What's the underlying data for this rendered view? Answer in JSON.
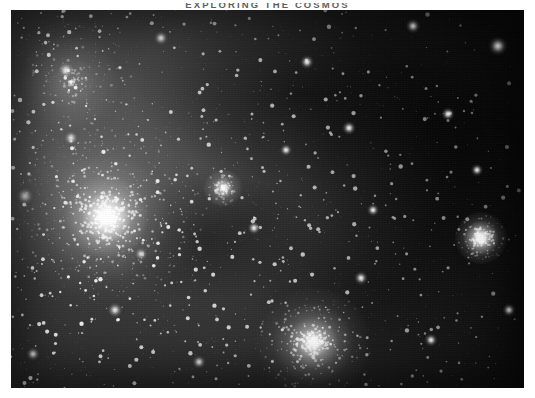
{
  "document": {
    "running_head": "EXPLORING THE COSMOS",
    "page_background": "#ffffff",
    "margins": {
      "left_px": 11,
      "right_px": 11,
      "top_px": 10,
      "bottom_px": 10
    }
  },
  "plate": {
    "kind": "astronomical-photograph",
    "rendering": "grayscale halftone print",
    "width_px": 513,
    "height_px": 378,
    "background_color": "#0a0a0a",
    "nebula_color": "#9a9a9a",
    "star_color": "#ffffff",
    "objects": [
      {
        "name": "antares-bright-star",
        "x": 96,
        "y": 207,
        "brightness": 1.0,
        "radius_px": 100
      },
      {
        "name": "m4-globular-cluster",
        "x": 302,
        "y": 333,
        "brightness": 0.92,
        "radius_px": 60
      },
      {
        "name": "sigma-scorpii-bright-star",
        "x": 470,
        "y": 228,
        "brightness": 0.96,
        "radius_px": 26
      },
      {
        "name": "m80-small-cluster",
        "x": 212,
        "y": 178,
        "brightness": 0.72,
        "radius_px": 20
      },
      {
        "name": "rho-ophiuchi-nebulosity",
        "x": 60,
        "y": 72,
        "brightness": 0.3,
        "radius_px": 75
      }
    ],
    "star_count": 2600,
    "dust_lanes": 4
  }
}
